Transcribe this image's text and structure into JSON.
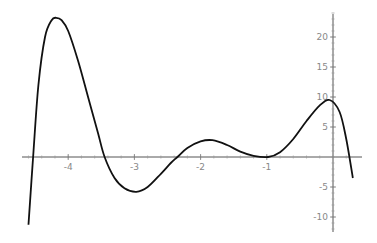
{
  "chart_data": {
    "type": "line",
    "title": "",
    "xlabel": "",
    "ylabel": "",
    "xlim": [
      -4.6,
      0.3
    ],
    "ylim": [
      -12,
      24
    ],
    "grid": false,
    "x_ticks": [
      -4,
      -3,
      -2,
      -1
    ],
    "x_tick_labels": [
      "-4",
      "-3",
      "-2",
      "-1"
    ],
    "y_ticks": [
      -10,
      -5,
      5,
      10,
      15,
      20
    ],
    "y_tick_labels": [
      "-10",
      "-5",
      "5",
      "10",
      "15",
      "20"
    ],
    "series": [
      {
        "name": "f(x)",
        "color": "#111111",
        "x": [
          -4.6,
          -4.53,
          -4.45,
          -4.35,
          -4.25,
          -4.18,
          -4.1,
          -4.0,
          -3.85,
          -3.7,
          -3.55,
          -3.45,
          -3.3,
          -3.15,
          -2.97,
          -2.8,
          -2.6,
          -2.45,
          -2.35,
          -2.2,
          -2.0,
          -1.82,
          -1.6,
          -1.4,
          -1.2,
          -0.98,
          -0.8,
          -0.6,
          -0.4,
          -0.2,
          -0.05,
          0.1,
          0.2,
          0.3
        ],
        "y": [
          -11.3,
          0,
          12,
          20,
          22.8,
          23.2,
          22.8,
          21,
          16,
          10,
          4,
          0,
          -3.5,
          -5.2,
          -5.8,
          -5.0,
          -2.8,
          -1.0,
          0,
          1.5,
          2.6,
          2.8,
          2.0,
          0.9,
          0.2,
          0,
          0.8,
          3.0,
          6.0,
          8.6,
          9.5,
          7.5,
          3.0,
          -3.5
        ]
      }
    ]
  }
}
